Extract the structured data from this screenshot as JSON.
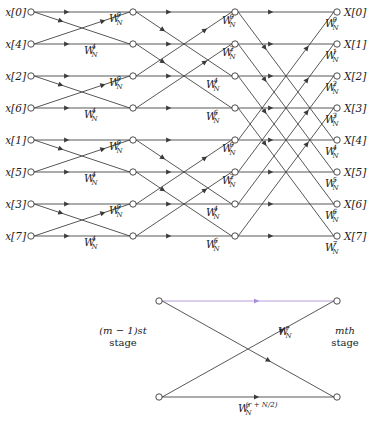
{
  "figure": {
    "colors": {
      "line": "#3a3a3a",
      "node_stroke": "#3a3a3a",
      "node_fill": "#ffffff",
      "text": "#1a1a1a",
      "highlight": "#a98ed4"
    },
    "geometry": {
      "columns_x": [
        31,
        133,
        235,
        337
      ],
      "rows_y": [
        12,
        44,
        76,
        108,
        140,
        172,
        204,
        236
      ],
      "node_radius": 3.2
    }
  },
  "inputs": {
    "label_x": 26,
    "items": [
      {
        "text": "x[0]",
        "row": 0,
        "index": 0
      },
      {
        "text": "x[4]",
        "row": 1,
        "index": 4
      },
      {
        "text": "x[2]",
        "row": 2,
        "index": 2
      },
      {
        "text": "x[6]",
        "row": 3,
        "index": 6
      },
      {
        "text": "x[1]",
        "row": 4,
        "index": 1
      },
      {
        "text": "x[5]",
        "row": 5,
        "index": 5
      },
      {
        "text": "x[3]",
        "row": 6,
        "index": 3
      },
      {
        "text": "x[7]",
        "row": 7,
        "index": 7
      }
    ]
  },
  "outputs": {
    "label_x": 344,
    "items": [
      {
        "text": "X[0]",
        "row": 0,
        "index": 0
      },
      {
        "text": "X[1]",
        "row": 1,
        "index": 1
      },
      {
        "text": "X[2]",
        "row": 2,
        "index": 2
      },
      {
        "text": "X[3]",
        "row": 3,
        "index": 3
      },
      {
        "text": "X[4]",
        "row": 4,
        "index": 4
      },
      {
        "text": "X[5]",
        "row": 5,
        "index": 5
      },
      {
        "text": "X[6]",
        "row": 6,
        "index": 6
      },
      {
        "text": "X[7]",
        "row": 7,
        "index": 7
      }
    ]
  },
  "stages": [
    {
      "name": "stage-1",
      "from_col": 0,
      "to_col": 1,
      "pairs": [
        [
          0,
          1
        ],
        [
          2,
          3
        ],
        [
          4,
          5
        ],
        [
          6,
          7
        ]
      ],
      "twiddles": [
        {
          "base": "W",
          "sub": "N",
          "sup": "0",
          "x": 109,
          "y": 22
        },
        {
          "base": "W",
          "sub": "N",
          "sup": "4",
          "x": 84,
          "y": 54
        },
        {
          "base": "W",
          "sub": "N",
          "sup": "0",
          "x": 109,
          "y": 86
        },
        {
          "base": "W",
          "sub": "N",
          "sup": "4",
          "x": 84,
          "y": 118
        },
        {
          "base": "W",
          "sub": "N",
          "sup": "0",
          "x": 109,
          "y": 150
        },
        {
          "base": "W",
          "sub": "N",
          "sup": "4",
          "x": 84,
          "y": 182
        },
        {
          "base": "W",
          "sub": "N",
          "sup": "0",
          "x": 109,
          "y": 214
        },
        {
          "base": "W",
          "sub": "N",
          "sup": "4",
          "x": 84,
          "y": 246
        }
      ]
    },
    {
      "name": "stage-2",
      "from_col": 1,
      "to_col": 2,
      "pairs": [
        [
          0,
          2
        ],
        [
          1,
          3
        ],
        [
          4,
          6
        ],
        [
          5,
          7
        ]
      ],
      "twiddles": [
        {
          "base": "W",
          "sub": "N",
          "sup": "0",
          "x": 222,
          "y": 24
        },
        {
          "base": "W",
          "sub": "N",
          "sup": "2",
          "x": 222,
          "y": 56
        },
        {
          "base": "W",
          "sub": "N",
          "sup": "4",
          "x": 206,
          "y": 88
        },
        {
          "base": "W",
          "sub": "N",
          "sup": "6",
          "x": 206,
          "y": 120
        },
        {
          "base": "W",
          "sub": "N",
          "sup": "0",
          "x": 222,
          "y": 152
        },
        {
          "base": "W",
          "sub": "N",
          "sup": "2",
          "x": 222,
          "y": 184
        },
        {
          "base": "W",
          "sub": "N",
          "sup": "4",
          "x": 206,
          "y": 216
        },
        {
          "base": "W",
          "sub": "N",
          "sup": "6",
          "x": 206,
          "y": 248
        }
      ]
    },
    {
      "name": "stage-3",
      "from_col": 2,
      "to_col": 3,
      "pairs": [
        [
          0,
          4
        ],
        [
          1,
          5
        ],
        [
          2,
          6
        ],
        [
          3,
          7
        ]
      ],
      "twiddles": [
        {
          "base": "W",
          "sub": "N",
          "sup": "0",
          "x": 325,
          "y": 27
        },
        {
          "base": "W",
          "sub": "N",
          "sup": "1",
          "x": 325,
          "y": 59
        },
        {
          "base": "W",
          "sub": "N",
          "sup": "2",
          "x": 325,
          "y": 91
        },
        {
          "base": "W",
          "sub": "N",
          "sup": "3",
          "x": 325,
          "y": 123
        },
        {
          "base": "W",
          "sub": "N",
          "sup": "4",
          "x": 325,
          "y": 155
        },
        {
          "base": "W",
          "sub": "N",
          "sup": "5",
          "x": 325,
          "y": 187
        },
        {
          "base": "W",
          "sub": "N",
          "sup": "6",
          "x": 325,
          "y": 219
        },
        {
          "base": "W",
          "sub": "N",
          "sup": "7",
          "x": 325,
          "y": 251
        }
      ]
    }
  ],
  "detail": {
    "name": "single-butterfly-detail",
    "left_x": 159,
    "right_x": 337,
    "top_y": 301,
    "bottom_y": 397,
    "highlight_edge": {
      "from": "top-left",
      "to": "top-right",
      "color": "#a98ed4"
    },
    "left_stage_label": {
      "line1": "(m − 1)st",
      "line2": "stage",
      "x": 123,
      "y": 334
    },
    "right_stage_label": {
      "line1": "mth",
      "line2": "stage",
      "x": 345,
      "y": 334
    },
    "twiddle_upper": {
      "base": "W",
      "sub": "N",
      "sup": "r",
      "x": 278,
      "y": 335
    },
    "twiddle_lower": {
      "base": "W",
      "sub": "N",
      "sup": "(r + N/2)",
      "x": 238,
      "y": 412
    }
  }
}
